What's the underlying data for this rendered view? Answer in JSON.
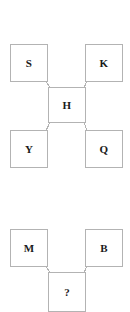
{
  "diagram": {
    "type": "node-link-analogy",
    "background_color": "#ffffff",
    "node_border_color": "#b3b3b3",
    "node_fill_color": "#ffffff",
    "edge_color": "#b3b3b3",
    "text_color": "#1a1a1a",
    "groups": [
      {
        "name": "top-cluster",
        "description": "Four outer boxes connected by diagonal lines to one central box",
        "nodes": [
          {
            "id": "s",
            "label": "S",
            "role": "outer-top-left",
            "x": 10,
            "y": 44,
            "w": 38,
            "h": 38
          },
          {
            "id": "k",
            "label": "K",
            "role": "outer-top-right",
            "x": 85,
            "y": 44,
            "w": 38,
            "h": 38
          },
          {
            "id": "h",
            "label": "H",
            "role": "center",
            "x": 48,
            "y": 87,
            "w": 38,
            "h": 36
          },
          {
            "id": "y",
            "label": "Y",
            "role": "outer-bottom-left",
            "x": 10,
            "y": 130,
            "w": 38,
            "h": 38
          },
          {
            "id": "q",
            "label": "Q",
            "role": "outer-bottom-right",
            "x": 85,
            "y": 130,
            "w": 38,
            "h": 38
          }
        ],
        "edges": [
          {
            "from": "s",
            "to": "h",
            "x1": 45,
            "y1": 79,
            "x2": 51,
            "y2": 90
          },
          {
            "from": "k",
            "to": "h",
            "x1": 88,
            "y1": 79,
            "x2": 83,
            "y2": 90
          },
          {
            "from": "y",
            "to": "h",
            "x1": 45,
            "y1": 133,
            "x2": 51,
            "y2": 120
          },
          {
            "from": "q",
            "to": "h",
            "x1": 88,
            "y1": 133,
            "x2": 83,
            "y2": 120
          }
        ]
      },
      {
        "name": "bottom-cluster",
        "description": "Two outer boxes connected by diagonal lines to one unknown box",
        "nodes": [
          {
            "id": "m",
            "label": "M",
            "role": "outer-left",
            "x": 10,
            "y": 229,
            "w": 38,
            "h": 38
          },
          {
            "id": "b",
            "label": "B",
            "role": "outer-right",
            "x": 85,
            "y": 229,
            "w": 38,
            "h": 38
          },
          {
            "id": "unknown",
            "label": "?",
            "role": "answer-slot",
            "x": 48,
            "y": 272,
            "w": 38,
            "h": 40
          }
        ],
        "edges": [
          {
            "from": "m",
            "to": "unknown",
            "x1": 45,
            "y1": 264,
            "x2": 51,
            "y2": 275
          },
          {
            "from": "b",
            "to": "unknown",
            "x1": 88,
            "y1": 264,
            "x2": 83,
            "y2": 275
          }
        ]
      }
    ]
  }
}
